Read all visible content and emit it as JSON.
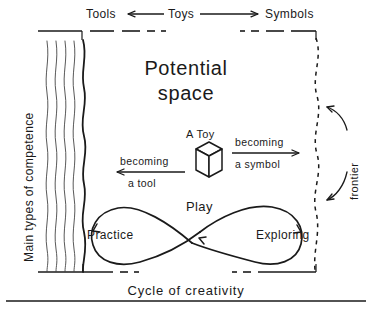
{
  "figure": {
    "title_line1": "Potential",
    "title_line2": "space",
    "top_axis": {
      "left_label": "Tools",
      "center_label": "Toys",
      "right_label": "Symbols",
      "left_arrow_icon": "arrow-left-icon",
      "right_arrow_icon": "arrow-right-icon"
    },
    "left_axis_label": "Main types of competence",
    "right_axis_label": "frontier",
    "bottom_label": "Cycle of creativity",
    "toy": {
      "label": "A Toy",
      "icon": "cube-icon"
    },
    "transform_left": {
      "line1": "becoming",
      "line2": "a tool",
      "arrow_icon": "arrow-left-icon"
    },
    "transform_right": {
      "line1": "becoming",
      "line2": "a symbol",
      "arrow_icon": "arrow-right-icon"
    },
    "play_cycle": {
      "label": "Play",
      "left_node": "Practice",
      "right_node": "Exploring",
      "shape_icon": "lemniscate-icon"
    },
    "colors": {
      "ink": "#1a1a1a",
      "background": "#ffffff"
    }
  }
}
